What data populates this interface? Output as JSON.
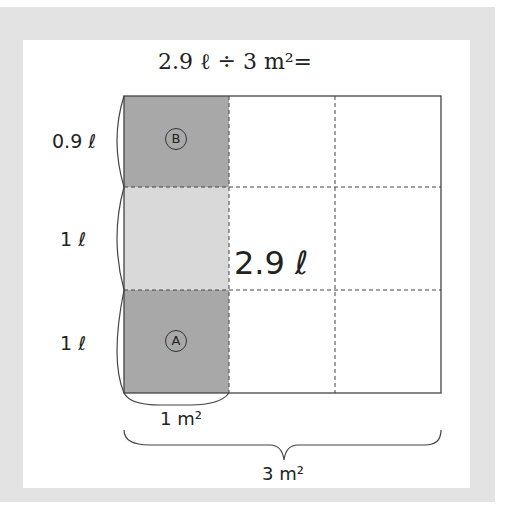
{
  "title": "2.9 ℓ ÷ 3 m²=",
  "total_label": "2.9 ℓ",
  "row_labels": [
    "0.9 ℓ",
    "1 ℓ",
    "1 ℓ"
  ],
  "cell_markers": {
    "top": "B",
    "bottom": "A"
  },
  "width_labels": {
    "one": "1 m²",
    "three": "3 m²"
  },
  "colors": {
    "frame": "#e3e3e3",
    "dark_fill": "#a8a8a8",
    "light_fill": "#d9d9d9",
    "line": "#444444"
  }
}
